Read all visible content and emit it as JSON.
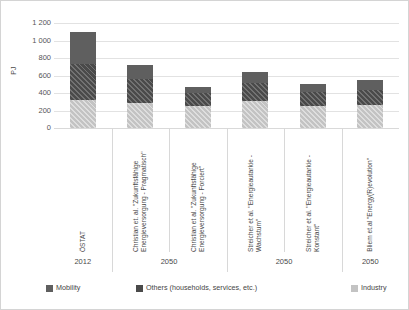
{
  "chart_data": {
    "type": "bar",
    "title": "",
    "xlabel": "",
    "ylabel": "PJ",
    "ylim": [
      0,
      1200
    ],
    "ytick_step": 200,
    "yticks": [
      "0",
      "200",
      "400",
      "600",
      "800",
      "1 000",
      "1 200"
    ],
    "grid": true,
    "stacked": true,
    "legend_position": "bottom",
    "categories": [
      "ÖSTAT",
      "Christian et. al. \"Zukunftsfähige Energieversorgung - Pragmatisch\"",
      "Christian et al. \"Zukunftsfähige Energieversorgung - Forciert\"",
      "Streicher et al. \"Energieautarkie - Wachstum\"",
      "Streicher et al. \"Energieautarkie - Konstant\"",
      "Bliem et.al \"Energy(R)evolution\""
    ],
    "group_years": [
      "2012",
      "2050",
      "2050",
      "2050"
    ],
    "series": [
      {
        "name": "Industry",
        "color": "#c3c3c3",
        "values": [
          320,
          285,
          250,
          310,
          250,
          260
        ]
      },
      {
        "name": "Others (households, services, etc.)",
        "color": "#4a4a4a",
        "values": [
          415,
          275,
          150,
          205,
          160,
          175
        ]
      },
      {
        "name": "Mobility",
        "color": "#5f5f5f",
        "values": [
          365,
          160,
          70,
          125,
          90,
          115
        ]
      }
    ],
    "totals": [
      1100,
      720,
      470,
      640,
      500,
      550
    ]
  },
  "legend": {
    "items": [
      {
        "label": "Mobility",
        "swatch": "#5f5f5f"
      },
      {
        "label": "Others (households, services, etc.)",
        "swatch": "#4a4a4a"
      },
      {
        "label": "Industry",
        "swatch": "#c3c3c3"
      }
    ]
  },
  "axis": {
    "y_title": "PJ"
  }
}
